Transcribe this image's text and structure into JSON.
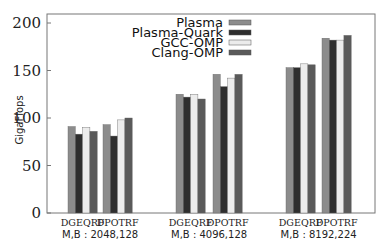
{
  "chart_data": {
    "type": "bar",
    "title": "",
    "xlabel": "",
    "ylabel": "GigaFlops",
    "ylim": [
      0,
      200
    ],
    "yticks": [
      0,
      50,
      100,
      150,
      200
    ],
    "grid": false,
    "legend_position": "top-center-inside",
    "groups": [
      {
        "label": "M,B : 2048,128",
        "categories": [
          "DGEQRF",
          "DPOTRF"
        ]
      },
      {
        "label": "M,B : 4096,128",
        "categories": [
          "DGEQRF",
          "DPOTRF"
        ]
      },
      {
        "label": "M,B : 8192,224",
        "categories": [
          "DGEQRF",
          "DPOTRF"
        ]
      }
    ],
    "categories": [
      "DGEQRF (2048,128)",
      "DPOTRF (2048,128)",
      "DGEQRF (4096,128)",
      "DPOTRF (4096,128)",
      "DGEQRF (8192,224)",
      "DPOTRF (8192,224)"
    ],
    "series": [
      {
        "name": "Plasma",
        "color": "#8c8c8c",
        "values": [
          91,
          93,
          125,
          146,
          153,
          184
        ]
      },
      {
        "name": "Plasma-Quark",
        "color": "#2e2e2e",
        "values": [
          83,
          81,
          122,
          133,
          153,
          182
        ]
      },
      {
        "name": "GCC-OMP",
        "color": "#ececec",
        "values": [
          90,
          98,
          125,
          142,
          157,
          182
        ]
      },
      {
        "name": "Clang-OMP",
        "color": "#5a5a5a",
        "values": [
          86,
          100,
          120,
          146,
          156,
          187
        ]
      }
    ]
  }
}
